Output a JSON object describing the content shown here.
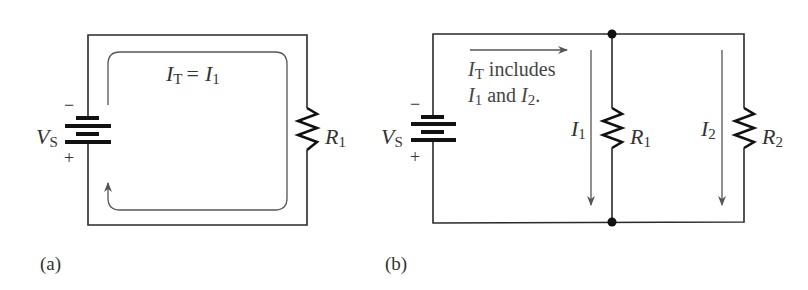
{
  "figure": {
    "panels": [
      {
        "id": "a",
        "caption": "(a)",
        "source_label": {
          "main": "V",
          "sub": "S"
        },
        "polarity": {
          "top": "−",
          "bottom": "+"
        },
        "resistors": [
          {
            "main": "R",
            "sub": "1"
          }
        ],
        "current_equation": {
          "lhs_main": "I",
          "lhs_sub": "T",
          "eq": "=",
          "rhs_main": "I",
          "rhs_sub": "1"
        },
        "topology": "series"
      },
      {
        "id": "b",
        "caption": "(b)",
        "source_label": {
          "main": "V",
          "sub": "S"
        },
        "polarity": {
          "top": "−",
          "bottom": "+"
        },
        "resistors": [
          {
            "main": "R",
            "sub": "1"
          },
          {
            "main": "R",
            "sub": "2"
          }
        ],
        "branch_currents": [
          {
            "main": "I",
            "sub": "1"
          },
          {
            "main": "I",
            "sub": "2"
          }
        ],
        "note_line1": {
          "main": "I",
          "sub": "T",
          "text": " includes"
        },
        "note_line2": {
          "a_main": "I",
          "a_sub": "1",
          "mid": " and ",
          "b_main": "I",
          "b_sub": "2",
          "end": "."
        },
        "topology": "parallel"
      }
    ],
    "colors": {
      "wire": "#2a2a2a",
      "flow_arrow": "#555555",
      "text": "#333333"
    }
  }
}
